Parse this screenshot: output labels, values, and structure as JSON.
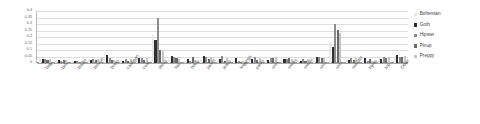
{
  "chart_data": {
    "type": "bar",
    "title": "",
    "xlabel": "",
    "ylabel": "",
    "ylim": [
      0,
      0.4
    ],
    "grid": true,
    "legend_position": "right",
    "ytick_labels": [
      "0.4",
      "0.35",
      "0.3",
      "0.25",
      "0.2",
      "0.15",
      "0.1",
      "0.05",
      "0"
    ],
    "ytick_values": [
      0.4,
      0.35,
      0.3,
      0.25,
      0.2,
      0.15,
      0.1,
      0.05,
      0
    ],
    "categories": [
      "bag",
      "belt",
      "blazer",
      "blouse",
      "boots",
      "cardigan",
      "coat",
      "dress",
      "hair",
      "heels",
      "jacket",
      "jeans",
      "leggings",
      "pants",
      "shirt",
      "shoes",
      "shorts",
      "skin",
      "skirt",
      "sweater",
      "tights",
      "top",
      "Other"
    ],
    "series": [
      {
        "name": "Bohemian",
        "color": "#e8e8e8",
        "values": [
          0.035,
          0.022,
          0.01,
          0.03,
          0.028,
          0.022,
          0.03,
          0.215,
          0.03,
          0.016,
          0.03,
          0.022,
          0.012,
          0.03,
          0.026,
          0.022,
          0.022,
          0.04,
          0.165,
          0.026,
          0.012,
          0.04,
          0.035
        ]
      },
      {
        "name": "Goth",
        "color": "#2e2e2e",
        "values": [
          0.03,
          0.02,
          0.014,
          0.022,
          0.06,
          0.016,
          0.04,
          0.175,
          0.055,
          0.03,
          0.055,
          0.03,
          0.04,
          0.03,
          0.02,
          0.03,
          0.016,
          0.05,
          0.125,
          0.026,
          0.035,
          0.03,
          0.06
        ]
      },
      {
        "name": "Hipster",
        "color": "#8c8c8c",
        "values": [
          0.028,
          0.018,
          0.012,
          0.028,
          0.035,
          0.03,
          0.04,
          0.35,
          0.045,
          0.012,
          0.05,
          0.055,
          0.016,
          0.045,
          0.04,
          0.03,
          0.03,
          0.045,
          0.3,
          0.035,
          0.014,
          0.045,
          0.05
        ]
      },
      {
        "name": "Pinup",
        "color": "#6a6a6a",
        "values": [
          0.026,
          0.022,
          0.01,
          0.026,
          0.02,
          0.018,
          0.026,
          0.1,
          0.035,
          0.045,
          0.03,
          0.014,
          0.01,
          0.02,
          0.035,
          0.035,
          0.014,
          0.04,
          0.255,
          0.02,
          0.03,
          0.04,
          0.045
        ]
      },
      {
        "name": "Preppy",
        "color": "#c4c4c4",
        "values": [
          0.03,
          0.02,
          0.016,
          0.03,
          0.022,
          0.03,
          0.035,
          0.09,
          0.03,
          0.02,
          0.045,
          0.04,
          0.014,
          0.04,
          0.045,
          0.028,
          0.03,
          0.04,
          0.23,
          0.04,
          0.016,
          0.05,
          0.055
        ]
      }
    ]
  }
}
